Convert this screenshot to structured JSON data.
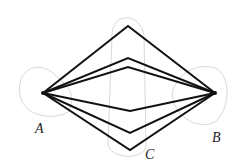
{
  "diagram": {
    "title": "",
    "points": {
      "A": {
        "label": "A",
        "x": 43,
        "y": 93
      },
      "B": {
        "label": "B",
        "x": 215,
        "y": 93
      }
    },
    "labels": [
      {
        "id": "A",
        "text": "A",
        "x": 35,
        "y": 133
      },
      {
        "id": "B",
        "text": "B",
        "x": 212,
        "y": 142
      },
      {
        "id": "C",
        "text": "C",
        "x": 145,
        "y": 159
      }
    ],
    "paths_upper_apex_y": [
      26,
      58,
      67
    ],
    "paths_lower_apex_y": [
      111,
      133,
      150
    ],
    "apex_x": 128,
    "colors": {
      "paths": "#111111",
      "regions": "#d8d8d8",
      "labels": "#222222"
    }
  }
}
